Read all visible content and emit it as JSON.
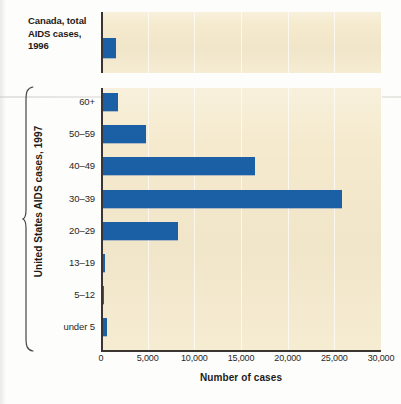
{
  "figure": {
    "colors": {
      "bar": "#1b60a5",
      "plot_background": "#f5eacd",
      "axis": "#3a3530",
      "page": "#ffffff",
      "gridline": "#ffffff"
    }
  },
  "top_panel": {
    "label": "Canada, total AIDS cases, 1996"
  },
  "main_panel": {
    "group_label": "United States AIDS cases, 1997"
  },
  "axis": {
    "x_title": "Number of cases",
    "x_ticks": [
      "0",
      "5,000",
      "10,000",
      "15,000",
      "20,000",
      "25,000",
      "30,000"
    ]
  },
  "chart_data": {
    "type": "bar",
    "orientation": "horizontal",
    "title": "",
    "subtitle": "",
    "xlabel": "Number of cases",
    "ylabel": "",
    "xlim": [
      0,
      30000
    ],
    "xticks": [
      0,
      5000,
      10000,
      15000,
      20000,
      25000,
      30000
    ],
    "xticklabels": [
      "0",
      "5,000",
      "10,000",
      "15,000",
      "20,000",
      "25,000",
      "30,000"
    ],
    "grid": true,
    "grid_axis": "x",
    "legend": false,
    "panels": [
      {
        "name": "Canada, total AIDS cases, 1996",
        "categories": [
          "Canada, total AIDS cases, 1996"
        ],
        "values": [
          1600
        ]
      },
      {
        "name": "United States AIDS cases, 1997",
        "ylabel": "United States AIDS cases, 1997",
        "categories": [
          "60+",
          "50–59",
          "40–49",
          "30–39",
          "20–29",
          "13–19",
          "5–12",
          "under 5"
        ],
        "values": [
          1800,
          4800,
          16500,
          25800,
          8300,
          400,
          250,
          600
        ]
      }
    ]
  }
}
